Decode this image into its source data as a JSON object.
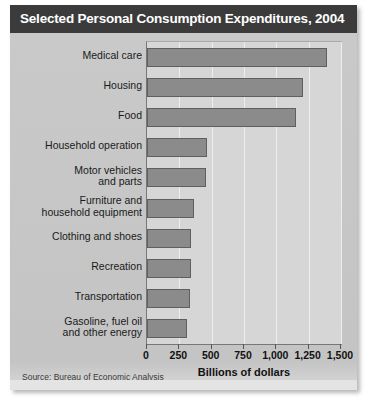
{
  "figure": {
    "title": "Selected Personal Consumption Expenditures, 2004",
    "source": "Source: Bureau of Economic Analysis",
    "accent_header_color": "#3b3b3b",
    "bar_color": "#8b8b8b",
    "plot_background": "#d6d6d6",
    "card_background": "#c9c9c9"
  },
  "chart_data": {
    "type": "bar",
    "orientation": "horizontal",
    "title": "Selected Personal Consumption Expenditures, 2004",
    "xlabel": "Billions of dollars",
    "ylabel": "",
    "xlim": [
      0,
      1500
    ],
    "xticks": [
      0,
      250,
      500,
      750,
      1000,
      1250,
      1500
    ],
    "xticklabels": [
      "0",
      "250",
      "500",
      "750",
      "1,000",
      "1,250",
      "1,500"
    ],
    "grid": true,
    "legend": false,
    "categories": [
      "Medical care",
      "Housing",
      "Food",
      "Household operation",
      "Motor vehicles\nand parts",
      "Furniture and\nhousehold equipment",
      "Clothing and shoes",
      "Recreation",
      "Transportation",
      "Gasoline, fuel oil\nand other energy"
    ],
    "values": [
      1390,
      1210,
      1155,
      465,
      460,
      365,
      340,
      340,
      335,
      310
    ],
    "units": "Billions of dollars",
    "source": "Bureau of Economic Analysis"
  }
}
